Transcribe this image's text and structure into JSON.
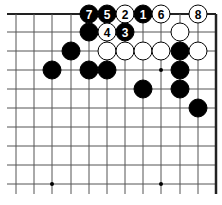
{
  "diagram": {
    "type": "go-board-fragment",
    "columns_x": [
      16,
      34,
      52,
      71,
      89,
      107,
      125,
      143,
      161,
      180,
      198,
      216
    ],
    "rows_y": [
      14,
      32,
      51,
      70,
      89,
      108,
      127,
      146,
      165,
      184
    ],
    "edges": {
      "top": true,
      "right": true,
      "left": false,
      "bottom": false
    },
    "hoshi": [
      {
        "c": 8,
        "r": 3
      },
      {
        "c": 2,
        "r": 9
      },
      {
        "c": 8,
        "r": 9
      }
    ],
    "colors": {
      "black": "#000000",
      "white": "#ffffff",
      "line": "#555555",
      "edge": "#222222"
    },
    "stones": [
      {
        "c": 4,
        "r": 0,
        "color": "black",
        "label": "7"
      },
      {
        "c": 5,
        "r": 0,
        "color": "black",
        "label": "5"
      },
      {
        "c": 6,
        "r": 0,
        "color": "white",
        "label": "2"
      },
      {
        "c": 7,
        "r": 0,
        "color": "black",
        "label": "1"
      },
      {
        "c": 8,
        "r": 0,
        "color": "white",
        "label": "6"
      },
      {
        "c": 10,
        "r": 0,
        "color": "white",
        "label": "8"
      },
      {
        "c": 4,
        "r": 1,
        "color": "black",
        "label": ""
      },
      {
        "c": 5,
        "r": 1,
        "color": "white",
        "label": "4"
      },
      {
        "c": 6,
        "r": 1,
        "color": "black",
        "label": "3"
      },
      {
        "c": 9,
        "r": 1,
        "color": "white",
        "label": ""
      },
      {
        "c": 3,
        "r": 2,
        "color": "black",
        "label": ""
      },
      {
        "c": 5,
        "r": 2,
        "color": "white",
        "label": ""
      },
      {
        "c": 6,
        "r": 2,
        "color": "white",
        "label": ""
      },
      {
        "c": 7,
        "r": 2,
        "color": "white",
        "label": ""
      },
      {
        "c": 8,
        "r": 2,
        "color": "white",
        "label": ""
      },
      {
        "c": 9,
        "r": 2,
        "color": "black",
        "label": ""
      },
      {
        "c": 10,
        "r": 2,
        "color": "white",
        "label": ""
      },
      {
        "c": 2,
        "r": 3,
        "color": "black",
        "label": ""
      },
      {
        "c": 4,
        "r": 3,
        "color": "black",
        "label": ""
      },
      {
        "c": 5,
        "r": 3,
        "color": "black",
        "label": ""
      },
      {
        "c": 9,
        "r": 3,
        "color": "black",
        "label": ""
      },
      {
        "c": 7,
        "r": 4,
        "color": "black",
        "label": ""
      },
      {
        "c": 9,
        "r": 4,
        "color": "black",
        "label": ""
      },
      {
        "c": 10,
        "r": 5,
        "color": "black",
        "label": ""
      }
    ]
  }
}
